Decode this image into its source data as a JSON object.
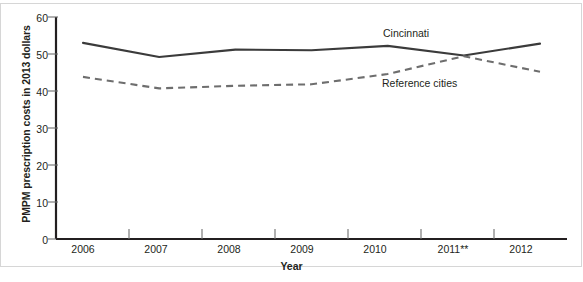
{
  "chart_data": {
    "type": "line",
    "title": "",
    "xlabel": "Year",
    "ylabel": "PMPM prescription costs in 2013 dollars",
    "categories": [
      "2006",
      "2007",
      "2008",
      "2009",
      "2010",
      "2011**",
      "2012"
    ],
    "xtick_labels": [
      "2006",
      "2007",
      "2008",
      "2009",
      "2010",
      "2011**",
      "2012"
    ],
    "ytick_labels": [
      "0",
      "10",
      "20",
      "30",
      "40",
      "50",
      "60"
    ],
    "ytick_values": [
      0,
      10,
      20,
      30,
      40,
      50,
      60
    ],
    "ylim": [
      0,
      60
    ],
    "grid": false,
    "legend_position": "inline-annotations",
    "series": [
      {
        "name": "Cincinnati",
        "style": "solid",
        "color": "#3b3b3b",
        "values": [
          53.0,
          49.2,
          51.2,
          51.0,
          52.2,
          49.6,
          52.8
        ]
      },
      {
        "name": "Reference cities",
        "style": "dashed",
        "color": "#6e6e6e",
        "values": [
          43.8,
          40.7,
          41.4,
          41.8,
          44.6,
          49.4,
          45.2
        ]
      }
    ],
    "annotations": [
      {
        "text": "Cincinnati",
        "x": "2010",
        "y": 54.5
      },
      {
        "text": "Reference cities",
        "x": "2010",
        "y": 41.0
      }
    ]
  }
}
